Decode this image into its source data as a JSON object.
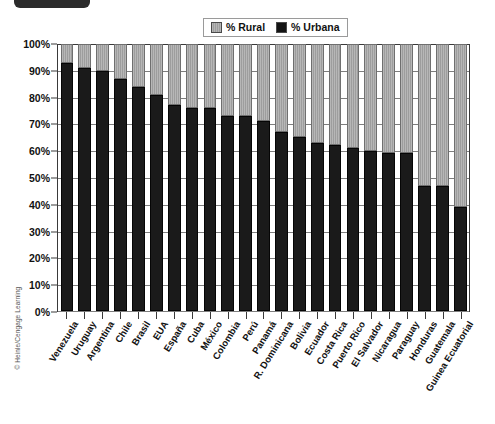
{
  "decor": {
    "top_tab": "top-tab-black",
    "copyright": "© Heinle/Cengage Learning"
  },
  "legend": {
    "position": "top-center",
    "entries": [
      {
        "label": "% Rural",
        "color": "#a9a9a9",
        "icon": "legend-swatch-rural"
      },
      {
        "label": "% Urbana",
        "color": "#1a1a1a",
        "icon": "legend-swatch-urbana"
      }
    ]
  },
  "axes": {
    "y_ticks": [
      "100%",
      "90%",
      "80%",
      "70%",
      "60%",
      "50%",
      "40%",
      "30%",
      "20%",
      "10%",
      "0%"
    ]
  },
  "chart_data": {
    "type": "bar",
    "subtype": "stacked-100-percent",
    "title": "",
    "xlabel": "",
    "ylabel": "",
    "ylim": [
      0,
      100
    ],
    "grid": true,
    "legend_position": "top-center",
    "categories": [
      "Venezuela",
      "Uruguay",
      "Argentina",
      "Chile",
      "Brasil",
      "EUA",
      "España",
      "Cuba",
      "México",
      "Colombia",
      "Perú",
      "Panamá",
      "R. Dominicana",
      "Bolivia",
      "Ecuador",
      "Costa Rica",
      "Puerto Rico",
      "El Salvador",
      "Nicaragua",
      "Paraguay",
      "Honduras",
      "Guatemala",
      "Guinea Ecuatorial"
    ],
    "series": [
      {
        "name": "% Urbana",
        "color": "#1a1a1a",
        "values": [
          93,
          91,
          90,
          87,
          84,
          81,
          77,
          76,
          76,
          73,
          73,
          71,
          67,
          65,
          63,
          62,
          61,
          60,
          59,
          59,
          47,
          47,
          39
        ]
      },
      {
        "name": "% Rural",
        "color": "#a9a9a9",
        "values": [
          7,
          9,
          10,
          13,
          16,
          19,
          23,
          24,
          24,
          27,
          27,
          29,
          33,
          35,
          37,
          38,
          39,
          40,
          41,
          41,
          53,
          53,
          61
        ]
      }
    ]
  }
}
